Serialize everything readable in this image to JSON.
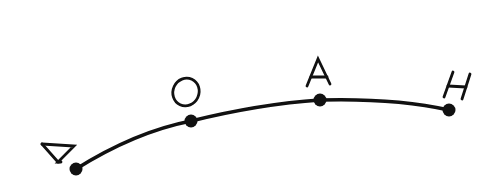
{
  "diagram": {
    "type": "curved-path-with-points",
    "stroke_color": "#111111",
    "background": "#ffffff",
    "points": [
      {
        "label": "N",
        "x": 76,
        "y": 169
      },
      {
        "label": "O",
        "x": 191,
        "y": 121
      },
      {
        "label": "A",
        "x": 320,
        "y": 100
      },
      {
        "label": "H",
        "x": 449,
        "y": 110
      }
    ]
  }
}
